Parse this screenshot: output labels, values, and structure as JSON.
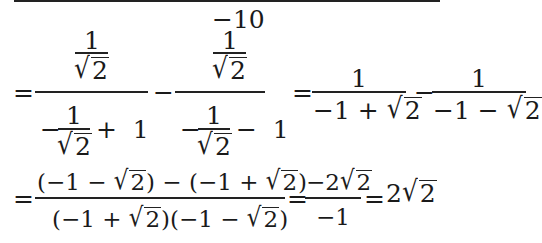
{
  "header": {
    "exponent_label": "−10"
  },
  "row1": {
    "eq1": "=",
    "frac_a": {
      "num_num": "1",
      "num_den_radicand": "2",
      "den_minus": "−",
      "den_inner_num": "1",
      "den_inner_radicand": "2",
      "den_tail": "+  1"
    },
    "op1": "−",
    "frac_b": {
      "num_num": "1",
      "num_den_radicand": "2",
      "den_minus": "−",
      "den_inner_num": "1",
      "den_inner_radicand": "2",
      "den_tail": "−  1"
    },
    "eq2": "=",
    "frac_c": {
      "num": "1",
      "den_pre": "−1 + ",
      "den_radicand": "2"
    },
    "op2": "−",
    "frac_d": {
      "num": "1",
      "den_pre": "−1 − ",
      "den_radicand": "2"
    }
  },
  "row2": {
    "eq1": "=",
    "frac_e": {
      "num_a_pre": "(−1 − ",
      "num_a_rad": "2",
      "num_mid": ") − (−1 + ",
      "num_b_rad": "2",
      "num_end": ")",
      "den_a_pre": "(−1 + ",
      "den_a_rad": "2",
      "den_mid": ")(−1 − ",
      "den_b_rad": "2",
      "den_end": ")"
    },
    "eq2": "=",
    "frac_f": {
      "num_pre": "−2",
      "num_rad": "2",
      "den": "−1"
    },
    "eq3": "=",
    "result_coef": "2",
    "result_rad": "2"
  }
}
